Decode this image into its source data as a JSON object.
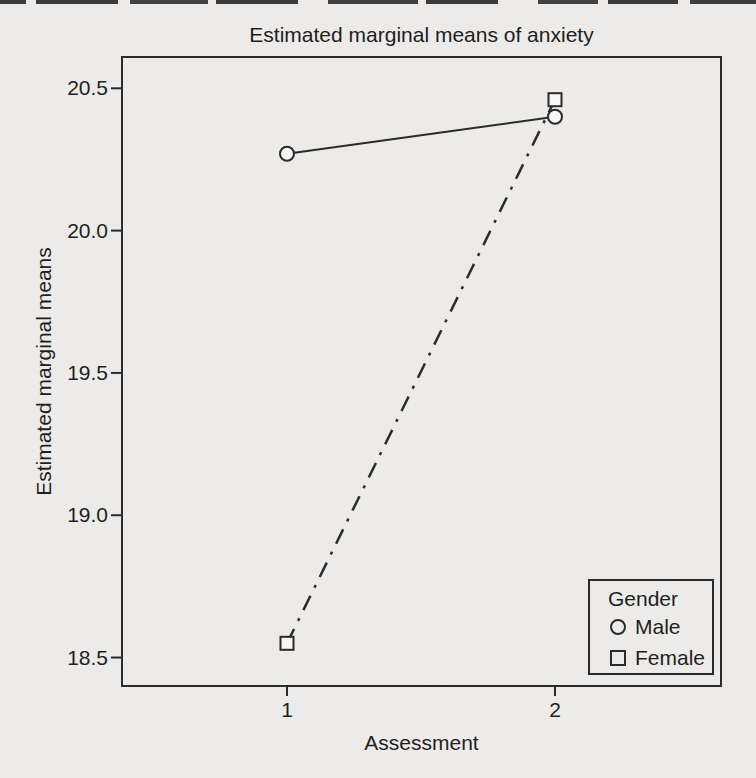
{
  "figure": {
    "title": "Estimated marginal means of anxiety",
    "colors": {
      "ink": "#2b2b2b",
      "paper": "#f7f6f4",
      "text": "#1f1f1f"
    },
    "scan_artifact": "dark-broken-strip-top-edge"
  },
  "chart_data": {
    "type": "line",
    "title": "Estimated marginal means of anxiety",
    "xlabel": "Assessment",
    "ylabel": "Estimated marginal means",
    "x": [
      1,
      2
    ],
    "x_tick_labels": [
      "1",
      "2"
    ],
    "series": [
      {
        "name": "Male",
        "marker": "circle",
        "line_style": "solid",
        "values": [
          20.27,
          20.4
        ]
      },
      {
        "name": "Female",
        "marker": "square",
        "line_style": "dash-dot",
        "values": [
          18.55,
          20.46
        ]
      }
    ],
    "y_ticks": [
      20.5,
      20.0,
      19.5,
      19.0,
      18.5
    ],
    "ylim": [
      18.4,
      20.61
    ],
    "grid": false,
    "legend": {
      "title": "Gender",
      "position": "bottom-right",
      "entries": [
        "Male",
        "Female"
      ]
    }
  }
}
